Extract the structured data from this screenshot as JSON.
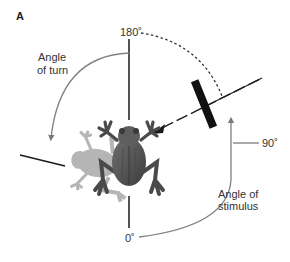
{
  "panel_label": "A",
  "labels": {
    "top_angle": "180˚",
    "right_angle": "90˚",
    "bottom_angle": "0˚",
    "turn_line1": "Angle",
    "turn_line2": "of turn",
    "stimulus_line1": "Angle of",
    "stimulus_line2": "stimulus"
  },
  "elements": {
    "subject": "frog (top view) with faded ghost showing turned position",
    "stimulus": "black bar moving toward frog",
    "turn_arrow": "gray curved arrow from 180° line counter-clockwise to left",
    "stimulus_arrow": "gray curved arrow from 0° clockwise up toward 90°",
    "dashed_arc": "dashed arc from 180° to stimulus line"
  },
  "colors": {
    "line": "#1a1a1a",
    "arc": "#808080",
    "frog_body": "#5a5a5a",
    "frog_ghost": "#9a9a9a",
    "bar": "#111111"
  }
}
